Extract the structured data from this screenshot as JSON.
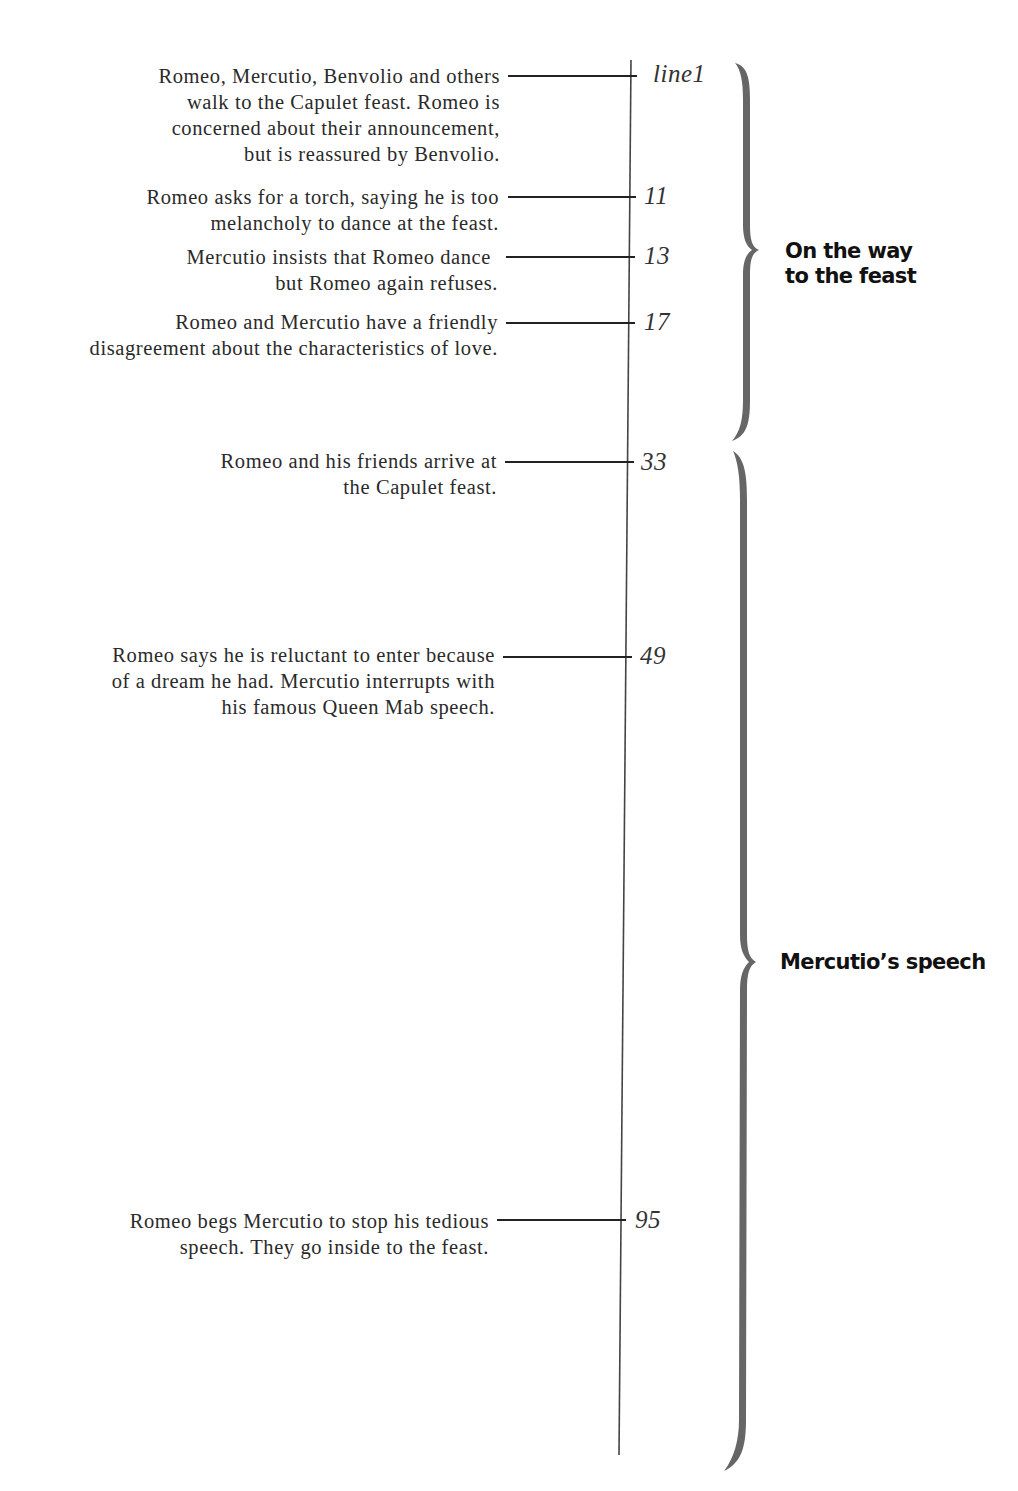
{
  "diagram": {
    "type": "timeline",
    "colors": {
      "text": "#2a2a2a",
      "axis": "#444444",
      "brace": "#666666",
      "label": "#111111"
    },
    "events": [
      {
        "line_label": "line1",
        "lines": [
          "Romeo, Mercutio, Benvolio and others",
          "walk to the Capulet feast. Romeo is",
          "concerned about their announcement,",
          "but is reassured by Benvolio."
        ]
      },
      {
        "line_label": "11",
        "lines": [
          "Romeo asks for a torch, saying he is too",
          "melancholy to dance at the feast."
        ]
      },
      {
        "line_label": "13",
        "lines": [
          "Mercutio insists that Romeo dance",
          "but Romeo again refuses."
        ]
      },
      {
        "line_label": "17",
        "lines": [
          "Romeo and Mercutio have a friendly",
          "disagreement about the characteristics of love."
        ]
      },
      {
        "line_label": "33",
        "lines": [
          "Romeo and his friends arrive at",
          "the Capulet feast."
        ]
      },
      {
        "line_label": "49",
        "lines": [
          "Romeo says he is reluctant to enter because",
          "of a dream he had. Mercutio interrupts with",
          "his famous Queen Mab speech."
        ]
      },
      {
        "line_label": "95",
        "lines": [
          "Romeo begs Mercutio to stop his tedious",
          "speech. They go inside to the feast."
        ]
      }
    ],
    "sections": [
      {
        "lines": [
          "On the way",
          "to the feast"
        ]
      },
      {
        "lines": [
          "Mercutio’s speech"
        ]
      }
    ]
  }
}
